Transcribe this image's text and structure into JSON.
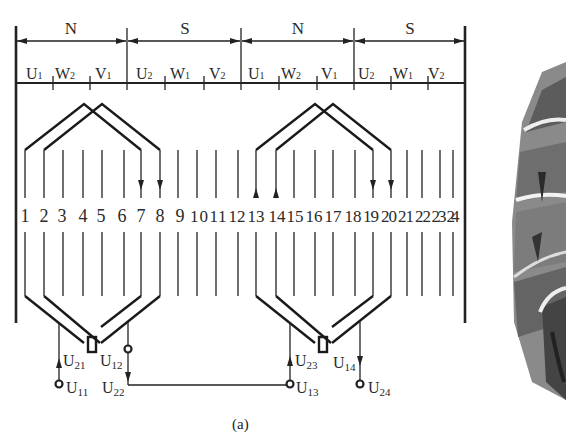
{
  "figure": {
    "caption": "(a)",
    "poles": [
      "N",
      "S",
      "N",
      "S"
    ],
    "phase_bands": [
      [
        "U1",
        "W2",
        "V1"
      ],
      [
        "U2",
        "W1",
        "V2"
      ],
      [
        "U1",
        "W2",
        "V1"
      ],
      [
        "U2",
        "W1",
        "V2"
      ]
    ],
    "slot_numbers": [
      "1",
      "2",
      "3",
      "4",
      "5",
      "6",
      "7",
      "8",
      "9",
      "10",
      "11",
      "12",
      "13",
      "14",
      "15",
      "16",
      "17",
      "18",
      "19",
      "20",
      "21",
      "22",
      "23",
      "24"
    ],
    "terminals": {
      "left_group": {
        "U21": "U21",
        "U12": "U12",
        "U11": "U11",
        "U22": "U22"
      },
      "right_group": {
        "U23": "U23",
        "U14": "U14",
        "U13": "U13",
        "U24": "U24"
      }
    },
    "photo_description": "partial photo of stator winding (cropped at right edge)"
  },
  "labels": {
    "pole_0": "N",
    "pole_1": "S",
    "pole_2": "N",
    "pole_3": "S",
    "b0_0": "U",
    "b0_0s": "1",
    "b0_1": "W",
    "b0_1s": "2",
    "b0_2": "V",
    "b0_2s": "1",
    "b1_0": "U",
    "b1_0s": "2",
    "b1_1": "W",
    "b1_1s": "1",
    "b1_2": "V",
    "b1_2s": "2",
    "b2_0": "U",
    "b2_0s": "1",
    "b2_1": "W",
    "b2_1s": "2",
    "b2_2": "V",
    "b2_2s": "1",
    "b3_0": "U",
    "b3_0s": "2",
    "b3_1": "W",
    "b3_1s": "1",
    "b3_2": "V",
    "b3_2s": "2",
    "t_U21": "U",
    "t_U21s": "21",
    "t_U12": "U",
    "t_U12s": "12",
    "t_U11": "U",
    "t_U11s": "11",
    "t_U22": "U",
    "t_U22s": "22",
    "t_U23": "U",
    "t_U23s": "23",
    "t_U14": "U",
    "t_U14s": "14",
    "t_U13": "U",
    "t_U13s": "13",
    "t_U24": "U",
    "t_U24s": "24",
    "caption": "(a)",
    "s1": "1",
    "s2": "2",
    "s3": "3",
    "s4": "4",
    "s5": "5",
    "s6": "6",
    "s7": "7",
    "s8": "8",
    "s9": "9",
    "s10": "10",
    "s11": "11",
    "s12": "12",
    "s13": "13",
    "s14": "14",
    "s15": "15",
    "s16": "16",
    "s17": "17",
    "s18": "18",
    "s19": "19",
    "s20": "20",
    "s21": "21",
    "s22": "22",
    "s23": "23",
    "s24": "24"
  }
}
